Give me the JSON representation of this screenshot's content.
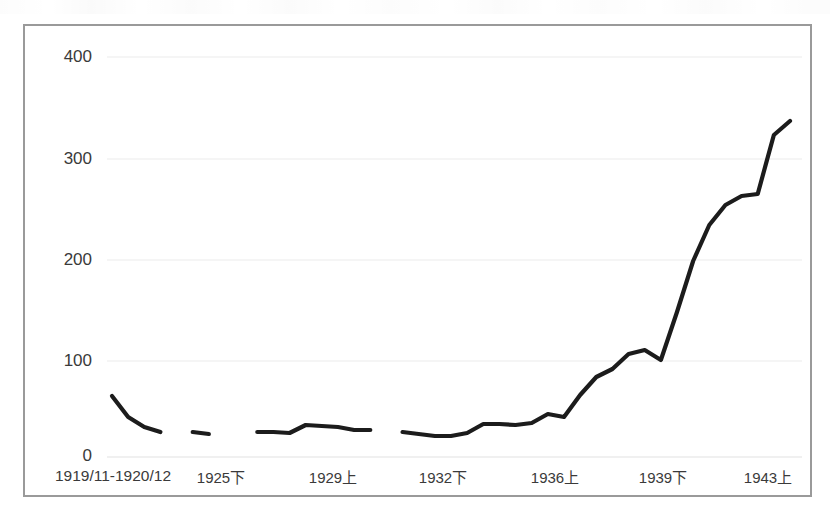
{
  "chart_data": {
    "type": "line",
    "title": "",
    "subtitle": "",
    "xlabel": "",
    "ylabel": "",
    "grid": true,
    "legend": false,
    "legend_position": "none",
    "ylim": [
      0,
      430
    ],
    "yticks": [
      0,
      100,
      200,
      300,
      400
    ],
    "ytick_labels": [
      "0",
      "100",
      "200",
      "300",
      "400"
    ],
    "xtick_labels": [
      "1919/11-1920/12",
      "1925下",
      "1929上",
      "1932下",
      "1936上",
      "1939下",
      "1943上"
    ],
    "series": [
      {
        "name": "series-1",
        "color": "#1c1c1c",
        "line_width": 4,
        "has_gaps": true,
        "points": [
          {
            "x": 0,
            "y": 61
          },
          {
            "x": 1,
            "y": 40
          },
          {
            "x": 2,
            "y": 30
          },
          {
            "x": 3,
            "y": 25
          },
          {
            "x": 4,
            "y": null
          },
          {
            "x": 5,
            "y": 25
          },
          {
            "x": 6,
            "y": 23
          },
          {
            "x": 7,
            "y": null
          },
          {
            "x": 8,
            "y": null
          },
          {
            "x": 9,
            "y": 25
          },
          {
            "x": 10,
            "y": 25
          },
          {
            "x": 11,
            "y": 24
          },
          {
            "x": 12,
            "y": 32
          },
          {
            "x": 13,
            "y": 31
          },
          {
            "x": 14,
            "y": 30
          },
          {
            "x": 15,
            "y": 27
          },
          {
            "x": 16,
            "y": 27
          },
          {
            "x": 17,
            "y": null
          },
          {
            "x": 18,
            "y": 25
          },
          {
            "x": 19,
            "y": 23
          },
          {
            "x": 20,
            "y": 21
          },
          {
            "x": 21,
            "y": 21
          },
          {
            "x": 22,
            "y": 24
          },
          {
            "x": 23,
            "y": 33
          },
          {
            "x": 24,
            "y": 33
          },
          {
            "x": 25,
            "y": 32
          },
          {
            "x": 26,
            "y": 34
          },
          {
            "x": 27,
            "y": 43
          },
          {
            "x": 28,
            "y": 40
          },
          {
            "x": 29,
            "y": 62
          },
          {
            "x": 30,
            "y": 80
          },
          {
            "x": 31,
            "y": 88
          },
          {
            "x": 32,
            "y": 103
          },
          {
            "x": 33,
            "y": 107
          },
          {
            "x": 34,
            "y": 97
          },
          {
            "x": 35,
            "y": 145
          },
          {
            "x": 36,
            "y": 196
          },
          {
            "x": 37,
            "y": 232
          },
          {
            "x": 38,
            "y": 252
          },
          {
            "x": 39,
            "y": 261
          },
          {
            "x": 40,
            "y": 263
          },
          {
            "x": 41,
            "y": 322
          },
          {
            "x": 42,
            "y": 336
          }
        ]
      }
    ]
  },
  "axes": {
    "y_ticks": [
      "400",
      "300",
      "200",
      "100",
      "0"
    ],
    "x_ticks": [
      "1919/11-1920/12",
      "1925下",
      "1929上",
      "1932下",
      "1936上",
      "1939下",
      "1943上"
    ]
  },
  "colors": {
    "line": "#1c1c1c",
    "grid": "#ececec",
    "frame": "#9a9a9a",
    "text": "#3a3a3a",
    "background": "#ffffff"
  }
}
